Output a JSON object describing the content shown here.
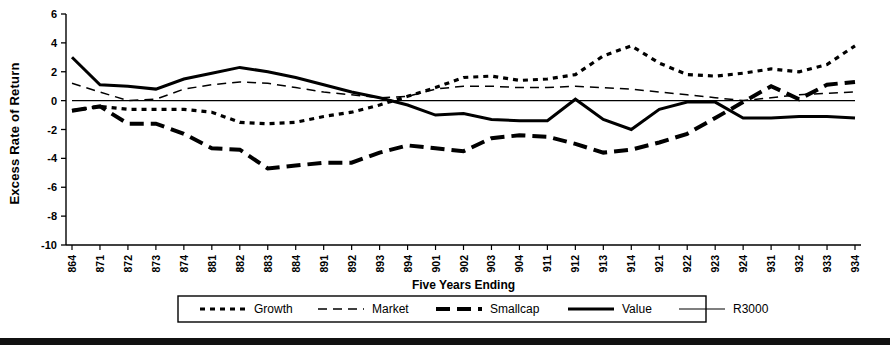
{
  "axes": {
    "ylabel": "Excess Rate of Return",
    "xlabel": "Five Years Ending",
    "y_ticks": [
      "6",
      "4",
      "2",
      "0",
      "-2",
      "-4",
      "-6",
      "-8",
      "-10"
    ]
  },
  "legend": {
    "items": [
      {
        "label": "Growth",
        "style": "dotted-thick"
      },
      {
        "label": "Market",
        "style": "dashed-thin"
      },
      {
        "label": "Smallcap",
        "style": "dash-thick"
      },
      {
        "label": "Value",
        "style": "solid-thick"
      },
      {
        "label": "R3000",
        "style": "solid-thin"
      }
    ]
  },
  "chart_data": {
    "type": "line",
    "title": "",
    "xlabel": "Five Years Ending",
    "ylabel": "Excess Rate of Return",
    "ylim": [
      -10,
      6
    ],
    "ytick_step": 2,
    "grid": false,
    "legend_position": "bottom",
    "categories": [
      "864",
      "871",
      "872",
      "873",
      "874",
      "881",
      "882",
      "883",
      "884",
      "891",
      "892",
      "893",
      "894",
      "901",
      "902",
      "903",
      "904",
      "911",
      "912",
      "913",
      "914",
      "921",
      "922",
      "923",
      "924",
      "931",
      "932",
      "933",
      "934"
    ],
    "series": [
      {
        "name": "Growth",
        "color": "#000000",
        "values": [
          -0.7,
          -0.4,
          -0.6,
          -0.6,
          -0.6,
          -0.8,
          -1.5,
          -1.6,
          -1.5,
          -1.1,
          -0.8,
          -0.3,
          0.3,
          0.9,
          1.6,
          1.7,
          1.4,
          1.5,
          1.8,
          3.1,
          3.8,
          2.6,
          1.8,
          1.7,
          1.9,
          2.2,
          2.0,
          2.5,
          3.8
        ]
      },
      {
        "name": "Market",
        "color": "#000000",
        "values": [
          1.2,
          0.6,
          0.0,
          0.1,
          0.8,
          1.1,
          1.3,
          1.2,
          0.9,
          0.6,
          0.4,
          0.2,
          0.3,
          0.8,
          1.0,
          1.0,
          0.9,
          0.9,
          1.0,
          0.9,
          0.8,
          0.6,
          0.4,
          0.2,
          0.0,
          0.2,
          0.4,
          0.5,
          0.6
        ]
      },
      {
        "name": "Smallcap",
        "color": "#000000",
        "values": [
          -0.7,
          -0.4,
          -1.6,
          -1.6,
          -2.3,
          -3.3,
          -3.4,
          -4.7,
          -4.5,
          -4.3,
          -4.3,
          -3.6,
          -3.1,
          -3.3,
          -3.5,
          -2.6,
          -2.4,
          -2.5,
          -3.0,
          -3.6,
          -3.4,
          -2.9,
          -2.3,
          -1.2,
          -0.1,
          1.0,
          0.1,
          1.1,
          1.3
        ]
      },
      {
        "name": "Value",
        "color": "#000000",
        "values": [
          3.0,
          1.1,
          1.0,
          0.8,
          1.5,
          1.9,
          2.3,
          2.0,
          1.6,
          1.1,
          0.6,
          0.2,
          -0.3,
          -1.0,
          -0.9,
          -1.3,
          -1.4,
          -1.4,
          0.1,
          -1.3,
          -2.0,
          -0.6,
          -0.1,
          -0.1,
          -1.2,
          -1.2,
          -1.1,
          -1.1,
          -1.2
        ]
      },
      {
        "name": "R3000",
        "color": "#000000",
        "values": [
          0,
          0,
          0,
          0,
          0,
          0,
          0,
          0,
          0,
          0,
          0,
          0,
          0,
          0,
          0,
          0,
          0,
          0,
          0,
          0,
          0,
          0,
          0,
          0,
          0,
          0,
          0,
          0,
          0
        ]
      }
    ]
  }
}
